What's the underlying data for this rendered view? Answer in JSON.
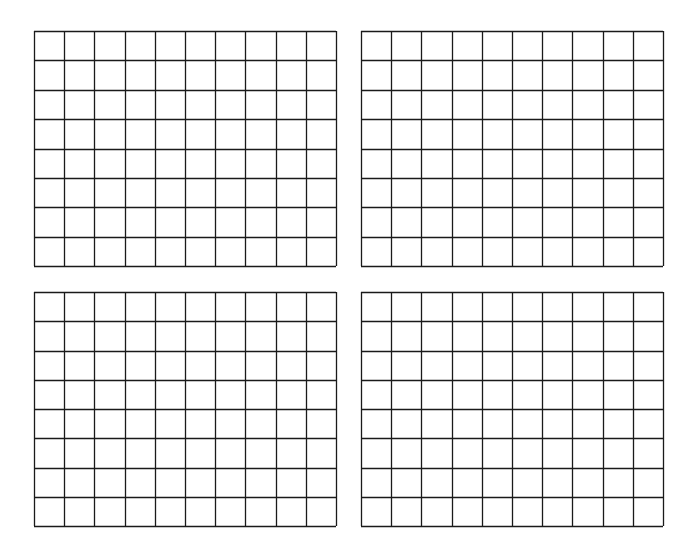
{
  "page": {
    "width": 700,
    "height": 556,
    "background": "#ffffff",
    "line_color": "#1a1a1a"
  },
  "grids": [
    {
      "name": "grid-top-left",
      "x": 34,
      "y": 31,
      "width": 302,
      "height": 235,
      "columns": 10,
      "rows": 8
    },
    {
      "name": "grid-top-right",
      "x": 361,
      "y": 31,
      "width": 302,
      "height": 235,
      "columns": 10,
      "rows": 8
    },
    {
      "name": "grid-bottom-left",
      "x": 34,
      "y": 292,
      "width": 302,
      "height": 234,
      "columns": 10,
      "rows": 8
    },
    {
      "name": "grid-bottom-right",
      "x": 361,
      "y": 292,
      "width": 302,
      "height": 234,
      "columns": 10,
      "rows": 8
    }
  ]
}
